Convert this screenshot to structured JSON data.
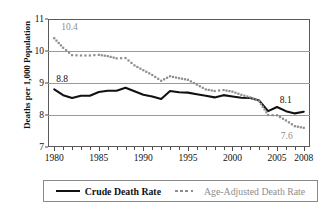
{
  "chart_data": {
    "type": "line",
    "title": "",
    "xlabel": "",
    "ylabel": "Deaths per 1,000 Population",
    "xlim": [
      1979.3,
      2008.7
    ],
    "ylim": [
      7,
      11
    ],
    "grid": true,
    "legend_position": "bottom",
    "y_ticks": [
      "7",
      "8",
      "9",
      "10",
      "11"
    ],
    "y_tick_values": [
      7,
      8,
      9,
      10,
      11
    ],
    "x_ticks": [
      "1980",
      "1985",
      "1990",
      "1995",
      "2000",
      "2005",
      "2008"
    ],
    "x_tick_values": [
      1980,
      1985,
      1990,
      1995,
      2000,
      2005,
      2008
    ],
    "x": [
      1980,
      1981,
      1982,
      1983,
      1984,
      1985,
      1986,
      1987,
      1988,
      1989,
      1990,
      1991,
      1992,
      1993,
      1994,
      1995,
      1996,
      1997,
      1998,
      1999,
      2000,
      2001,
      2002,
      2003,
      2004,
      2005,
      2006,
      2007,
      2008
    ],
    "series": [
      {
        "name": "Crude Death Rate",
        "style": "solid",
        "color": "#111111",
        "values": [
          8.8,
          8.62,
          8.53,
          8.6,
          8.6,
          8.72,
          8.76,
          8.76,
          8.85,
          8.74,
          8.63,
          8.58,
          8.5,
          8.75,
          8.71,
          8.7,
          8.65,
          8.6,
          8.55,
          8.62,
          8.58,
          8.54,
          8.53,
          8.45,
          8.12,
          8.25,
          8.12,
          8.05,
          8.1
        ]
      },
      {
        "name": "Age-Adjusted Death Rate",
        "style": "dotted",
        "color": "#8d8d8d",
        "values": [
          10.4,
          10.1,
          9.87,
          9.86,
          9.86,
          9.88,
          9.84,
          9.77,
          9.78,
          9.55,
          9.4,
          9.25,
          9.07,
          9.21,
          9.15,
          9.1,
          8.95,
          8.8,
          8.75,
          8.78,
          8.73,
          8.63,
          8.55,
          8.43,
          8.0,
          7.99,
          7.83,
          7.65,
          7.6
        ]
      }
    ],
    "annotations": [
      {
        "text": "10.4",
        "series": "Age-Adjusted Death Rate",
        "x": 1980,
        "y": 10.4,
        "color": "#8d8d8d"
      },
      {
        "text": "8.8",
        "series": "Crude Death Rate",
        "x": 1980,
        "y": 8.8,
        "color": "#111111"
      },
      {
        "text": "8.1",
        "series": "Crude Death Rate",
        "x": 2008,
        "y": 8.1,
        "color": "#111111"
      },
      {
        "text": "7.6",
        "series": "Age-Adjusted Death Rate",
        "x": 2008,
        "y": 7.6,
        "color": "#8d8d8d"
      }
    ]
  },
  "legend": {
    "crude_label": "Crude Death Rate",
    "adjusted_label": "Age-Adjusted Death Rate"
  }
}
